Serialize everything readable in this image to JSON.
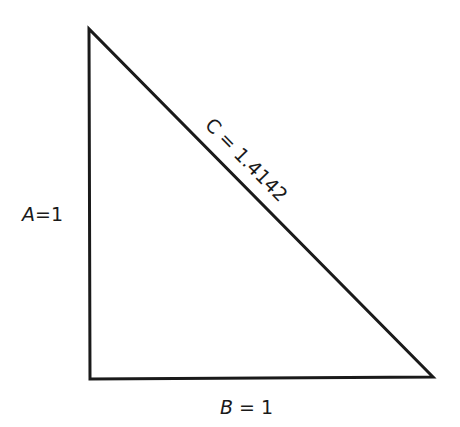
{
  "diagram": {
    "type": "right-triangle",
    "sides": {
      "a": {
        "name": "A",
        "value": "1",
        "label": "A=1"
      },
      "b": {
        "name": "B",
        "value": "1",
        "label": "B=1"
      },
      "c": {
        "name": "C",
        "value": "1.4142",
        "label": "C = 1.4142"
      }
    },
    "vertices": {
      "top": [
        89,
        29
      ],
      "bottom_left": [
        90,
        379
      ],
      "bottom_right": [
        433,
        377
      ]
    },
    "stroke_color": "#1a1a1a"
  }
}
